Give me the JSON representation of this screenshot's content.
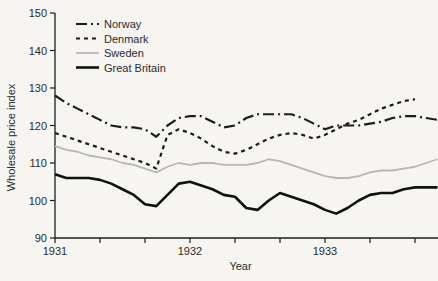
{
  "colors": {
    "ink": "#1c1c1c",
    "sweden_gray": "#b8b7b3",
    "background": "#f6f5f2",
    "text": "#2b2b2b"
  },
  "chart_data": {
    "type": "line",
    "title": "",
    "xlabel": "Year",
    "ylabel": "Wholesale price index",
    "ylim": [
      90,
      150
    ],
    "yticks": [
      90,
      100,
      110,
      120,
      130,
      140,
      150
    ],
    "x_unit": "month index from Jan 1931, monthly points",
    "x_major_ticks": [
      {
        "month": 0,
        "label": "1931"
      },
      {
        "month": 12,
        "label": "1932"
      },
      {
        "month": 24,
        "label": "1933"
      }
    ],
    "x_minor_tick_months": [
      4,
      8,
      16,
      20,
      28,
      32
    ],
    "grid": false,
    "legend_position": "top-left",
    "legend_entries": [
      "Norway",
      "Denmark",
      "Sweden",
      "Great Britain"
    ],
    "series": [
      {
        "name": "Norway",
        "color": "#1c1c1c",
        "line_style": "long-dash-dot",
        "dasharray": "11,4,2,4",
        "width": 2.2,
        "values": [
          128,
          126,
          124.5,
          123,
          121.5,
          120,
          119.5,
          119.5,
          119,
          117,
          120,
          122,
          122.5,
          122.5,
          121,
          119.5,
          120,
          122,
          123,
          123,
          123,
          123,
          122,
          120.5,
          119,
          120,
          120,
          120,
          120.5,
          121,
          122,
          122.5,
          122.5,
          122,
          121.5
        ]
      },
      {
        "name": "Denmark",
        "color": "#1c1c1c",
        "line_style": "short-dash",
        "dasharray": "4,4",
        "width": 2.2,
        "values": [
          118,
          117,
          116,
          115,
          114,
          113,
          112,
          111,
          110,
          108.5,
          117.5,
          119,
          118,
          116.5,
          114.5,
          113,
          112.5,
          113.5,
          115,
          116.5,
          117.5,
          118,
          117.5,
          116.5,
          117.5,
          119,
          120.5,
          121.5,
          123,
          124.5,
          125.5,
          126.5,
          127,
          null,
          null
        ]
      },
      {
        "name": "Sweden",
        "color": "#b8b7b3",
        "line_style": "solid",
        "dasharray": "",
        "width": 1.8,
        "values": [
          114.5,
          113.5,
          113,
          112,
          111.5,
          111,
          110,
          109.5,
          108.5,
          107.5,
          109,
          110,
          109.5,
          110,
          110,
          109.5,
          109.5,
          109.5,
          110,
          111,
          110.5,
          109.5,
          108.5,
          107.5,
          106.5,
          106,
          106,
          106.5,
          107.5,
          108,
          108,
          108.5,
          109,
          110,
          111
        ]
      },
      {
        "name": "Great Britain",
        "color": "#111111",
        "line_style": "solid",
        "dasharray": "",
        "width": 2.6,
        "values": [
          107,
          106,
          106,
          106,
          105.5,
          104.5,
          103,
          101.5,
          99,
          98.5,
          101.5,
          104.5,
          105,
          104,
          103,
          101.5,
          101,
          98,
          97.5,
          100,
          102,
          101,
          100,
          99,
          97.5,
          96.5,
          98,
          100,
          101.5,
          102,
          102,
          103,
          103.5,
          103.5,
          103.5
        ]
      }
    ]
  }
}
